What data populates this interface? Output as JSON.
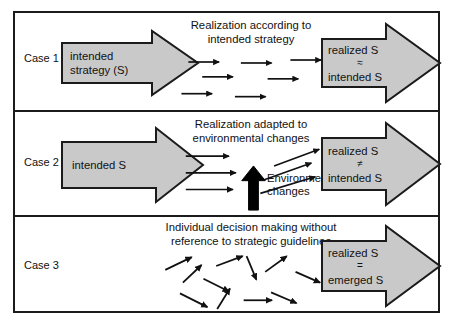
{
  "figure": {
    "background": "#ffffff",
    "frame_color": "#1b1b1b",
    "arrow_fill": "#c9c9c9",
    "arrow_stroke": "#1b1b1b",
    "black_arrow_color": "#000000"
  },
  "rows": [
    {
      "case_label": "Case 1",
      "caption": "Realization according to\nintended strategy",
      "left_arrow": {
        "lines": [
          "intended",
          "strategy (S)"
        ]
      },
      "right_arrow": {
        "top": "realized S",
        "symbol": "≈",
        "bottom": "intended S"
      },
      "flow_style": "parallel-horizontal",
      "flow_arrows": [
        {
          "x1": 175,
          "y1": 49,
          "x2": 208,
          "y2": 49
        },
        {
          "x1": 228,
          "y1": 50,
          "x2": 261,
          "y2": 50
        },
        {
          "x1": 278,
          "y1": 47,
          "x2": 311,
          "y2": 47
        },
        {
          "x1": 189,
          "y1": 64,
          "x2": 222,
          "y2": 64
        },
        {
          "x1": 255,
          "y1": 66,
          "x2": 288,
          "y2": 66
        },
        {
          "x1": 168,
          "y1": 81,
          "x2": 201,
          "y2": 81
        },
        {
          "x1": 222,
          "y1": 84,
          "x2": 255,
          "y2": 84
        }
      ]
    },
    {
      "case_label": "Case 2",
      "caption": "Realization adapted to\nenvironmental changes",
      "left_arrow": {
        "lines": [
          "intended S"
        ]
      },
      "right_arrow": {
        "top": "realized S",
        "symbol": "≠",
        "bottom": "intended S"
      },
      "environmental_label": "Environmental\nchanges",
      "flow_style": "deflected",
      "flow_arrows": [
        {
          "x1": 172,
          "y1": 45,
          "x2": 218,
          "y2": 45
        },
        {
          "x1": 172,
          "y1": 62,
          "x2": 225,
          "y2": 62
        },
        {
          "x1": 172,
          "y1": 79,
          "x2": 222,
          "y2": 79
        },
        {
          "x1": 262,
          "y1": 55,
          "x2": 310,
          "y2": 38
        },
        {
          "x1": 252,
          "y1": 68,
          "x2": 302,
          "y2": 52
        },
        {
          "x1": 248,
          "y1": 82,
          "x2": 306,
          "y2": 66
        }
      ],
      "vertical_arrow": {
        "x": 241,
        "y_bottom": 100,
        "y_top": 58
      }
    },
    {
      "case_label": "Case 3",
      "caption": "Individual decision making without\nreference to strategic guidelines",
      "left_arrow": null,
      "right_arrow": {
        "top": "realized S",
        "symbol": "=",
        "bottom": "emerged S"
      },
      "flow_style": "scattered",
      "flow_arrows": [
        {
          "x1": 151,
          "y1": 54,
          "x2": 180,
          "y2": 40
        },
        {
          "x1": 169,
          "y1": 67,
          "x2": 190,
          "y2": 48
        },
        {
          "x1": 203,
          "y1": 50,
          "x2": 232,
          "y2": 39
        },
        {
          "x1": 234,
          "y1": 39,
          "x2": 245,
          "y2": 66
        },
        {
          "x1": 253,
          "y1": 56,
          "x2": 277,
          "y2": 39
        },
        {
          "x1": 284,
          "y1": 56,
          "x2": 311,
          "y2": 68
        },
        {
          "x1": 190,
          "y1": 63,
          "x2": 218,
          "y2": 77
        },
        {
          "x1": 166,
          "y1": 78,
          "x2": 196,
          "y2": 94
        },
        {
          "x1": 204,
          "y1": 95,
          "x2": 218,
          "y2": 72
        },
        {
          "x1": 231,
          "y1": 85,
          "x2": 262,
          "y2": 85
        },
        {
          "x1": 259,
          "y1": 77,
          "x2": 287,
          "y2": 89
        }
      ]
    }
  ]
}
